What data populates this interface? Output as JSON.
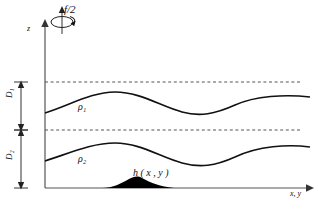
{
  "figure": {
    "labels": {
      "rotation": "f/2",
      "z_axis": "z",
      "xy_axis": "x, y",
      "depth_upper": "D₁",
      "depth_lower": "D₂",
      "density_upper": "ρ₁",
      "density_lower": "ρ₂",
      "topography": "h ( x , y )"
    },
    "colors": {
      "stroke": "#1a1a1a",
      "axis": "#555555",
      "dashed": "#555555",
      "topography_fill": "#000000",
      "background": "#ffffff"
    },
    "elements": {
      "rotation_axis_icon": "rotation-arrow-icon",
      "z_axis_arrow": "arrow-up-icon",
      "xy_axis_arrow": "arrow-right-icon",
      "depth_arrow_upper": "double-headed-arrow-icon",
      "depth_arrow_lower": "double-headed-arrow-icon"
    },
    "geometry": {
      "origin": [
        45,
        188
      ],
      "dashed_level_top_y": 82,
      "dashed_level_mid_y": 130,
      "interface_upper_path": "M45,113 C70,105 92,92 115,92 C140,92 160,106 182,112 C200,117 215,114 235,105 C255,96 285,94 310,97",
      "interface_lower_path": "M45,161 C70,153 92,143 115,143 C140,143 160,157 182,163 C200,168 215,166 235,157 C258,146 288,144 310,147",
      "topography_path": "M45,188 L100,188 C112,188 120,184 128,179 C133,176 137,175 141,177 C150,181 158,186 172,188 L250,188 L310,188 Z",
      "axis_x_end": [
        312,
        188
      ],
      "axis_y_top": [
        45,
        22
      ]
    }
  }
}
